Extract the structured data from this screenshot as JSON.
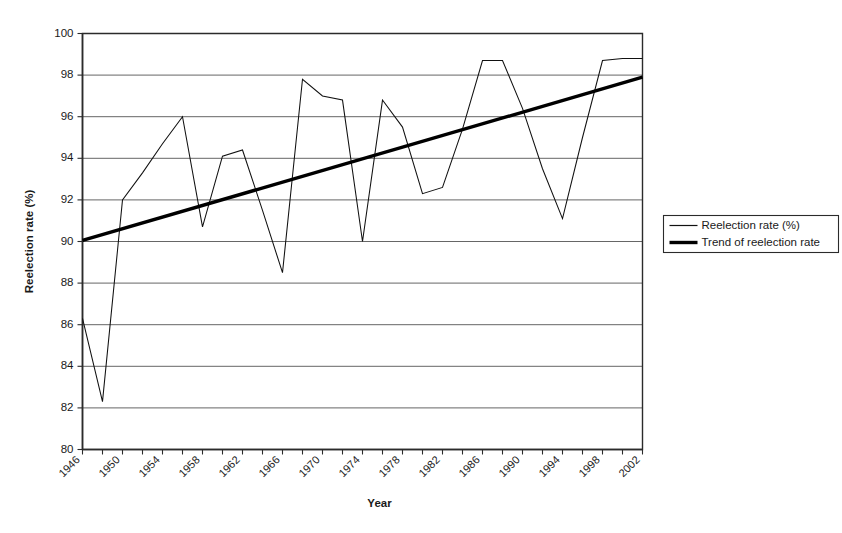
{
  "chart_data": {
    "type": "line",
    "title": "",
    "xlabel": "Year",
    "ylabel": "Reelection rate (%)",
    "xlim": [
      1946,
      2002
    ],
    "ylim": [
      80,
      100
    ],
    "ytick_interval": 2,
    "xtick_interval": 2,
    "xtick_label_interval": 4,
    "grid": "horizontal",
    "legend_position": "right",
    "x": [
      1946,
      1948,
      1950,
      1952,
      1954,
      1956,
      1958,
      1960,
      1962,
      1964,
      1966,
      1968,
      1970,
      1972,
      1974,
      1976,
      1978,
      1980,
      1982,
      1984,
      1986,
      1988,
      1990,
      1992,
      1994,
      1996,
      1998,
      2000,
      2002
    ],
    "series": [
      {
        "name": "Reelection rate (%)",
        "style": "thin",
        "color": "#111111",
        "values": [
          86.3,
          82.3,
          92.0,
          93.3,
          94.7,
          96.0,
          90.7,
          94.1,
          94.4,
          91.5,
          88.5,
          97.8,
          97.0,
          96.8,
          90.0,
          96.8,
          95.5,
          92.3,
          92.6,
          95.4,
          98.7,
          98.7,
          96.4,
          93.5,
          91.1,
          95.0,
          98.7,
          98.8,
          98.8
        ]
      },
      {
        "name": "Trend of reelection rate",
        "style": "thick",
        "color": "#000000",
        "kind": "trend",
        "endpoints": [
          {
            "x": 1946,
            "y": 90.05
          },
          {
            "x": 2002,
            "y": 97.9
          }
        ]
      }
    ],
    "ytick_labels": [
      "100",
      "98",
      "96",
      "94",
      "92",
      "90",
      "88",
      "86",
      "84",
      "82",
      "80"
    ],
    "ytick_values": [
      100,
      98,
      96,
      94,
      92,
      90,
      88,
      86,
      84,
      82,
      80
    ],
    "xtick_labels": [
      "1946",
      "1950",
      "1954",
      "1958",
      "1962",
      "1966",
      "1970",
      "1974",
      "1978",
      "1982",
      "1986",
      "1990",
      "1994",
      "1998",
      "2002"
    ],
    "xtick_label_values": [
      1946,
      1950,
      1954,
      1958,
      1962,
      1966,
      1970,
      1974,
      1978,
      1982,
      1986,
      1990,
      1994,
      1998,
      2002
    ]
  },
  "legend": {
    "items": [
      {
        "label": "Reelection rate (%)",
        "style": "thin"
      },
      {
        "label": "Trend of reelection rate",
        "style": "thick"
      }
    ]
  },
  "axes": {
    "y_title": "Reelection rate (%)",
    "x_title": "Year"
  }
}
